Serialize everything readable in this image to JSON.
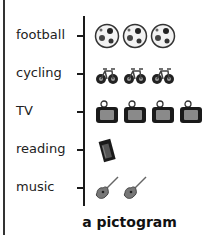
{
  "chart_data": {
    "type": "pictogram",
    "title": "a pictogram",
    "categories": [
      "football",
      "cycling",
      "TV",
      "reading",
      "music"
    ],
    "values": [
      3,
      3,
      4,
      1,
      2
    ],
    "icons": [
      "football-icon",
      "bicycle-icon",
      "tv-icon",
      "book-icon",
      "guitar-icon"
    ],
    "xlabel": "",
    "ylabel": "",
    "grid": false,
    "legend": null
  },
  "rows": [
    {
      "label": "football",
      "count": 3,
      "icon": "football-icon"
    },
    {
      "label": "cycling",
      "count": 3,
      "icon": "bicycle-icon"
    },
    {
      "label": "TV",
      "count": 4,
      "icon": "tv-icon"
    },
    {
      "label": "reading",
      "count": 1,
      "icon": "book-icon"
    },
    {
      "label": "music",
      "count": 2,
      "icon": "guitar-icon"
    }
  ],
  "title": "a pictogram"
}
